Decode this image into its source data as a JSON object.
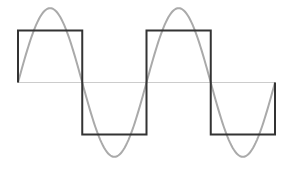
{
  "chart_data": {
    "type": "line",
    "title": "",
    "xlabel": "",
    "ylabel": "",
    "grid": false,
    "legend": null,
    "x_range": [
      0,
      2
    ],
    "y_range": [
      -1.43,
      1.43
    ],
    "x_unit": "periods",
    "series": [
      {
        "name": "square wave",
        "color": "#333333",
        "style": "step",
        "amplitude": 1.0,
        "points": [
          [
            0,
            0
          ],
          [
            0,
            1
          ],
          [
            0.5,
            1
          ],
          [
            0.5,
            -1
          ],
          [
            1,
            -1
          ],
          [
            1,
            1
          ],
          [
            1.5,
            1
          ],
          [
            1.5,
            -1
          ],
          [
            2,
            -1
          ],
          [
            2,
            0
          ]
        ]
      },
      {
        "name": "sine wave",
        "color": "#aaaaaa",
        "style": "smooth",
        "amplitude": 1.43,
        "periods": 2
      },
      {
        "name": "zero axis",
        "color": "#cccccc",
        "style": "line",
        "points": [
          [
            0,
            0
          ],
          [
            2,
            0
          ]
        ]
      }
    ]
  },
  "layout": {
    "x0_px": 18,
    "x1_px": 275,
    "mid_px": 82.5,
    "unit_px": 52
  }
}
